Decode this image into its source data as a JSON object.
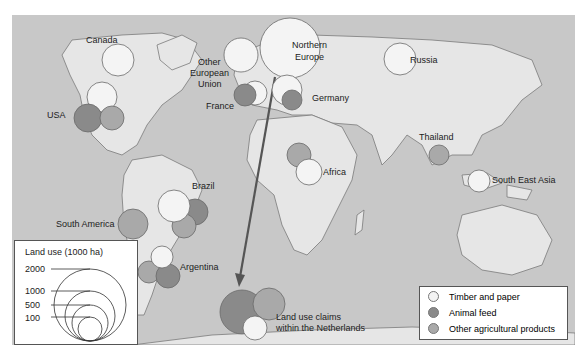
{
  "colors": {
    "ocean": "#c8c8c8",
    "land": "#e6e6e6",
    "coast": "#7a7a7a",
    "timber": "#f4f4f4",
    "feed": "#8a8a8a",
    "other": "#a9a9a9",
    "arrow": "#555555"
  },
  "labels": {
    "canada": "Canada",
    "usa": "USA",
    "other_eu_1": "Other",
    "other_eu_2": "European",
    "other_eu_3": "Union",
    "northern_europe_1": "Northern",
    "northern_europe_2": "Europe",
    "france": "France",
    "germany": "Germany",
    "russia": "Russia",
    "thailand": "Thailand",
    "south_east_asia": "South East Asia",
    "africa": "Africa",
    "brazil": "Brazil",
    "south_america": "South America",
    "argentina": "Argentina",
    "netherlands_1": "Land use claims",
    "netherlands_2": "within the Netherlands"
  },
  "size_legend": {
    "title": "Land use (1000 ha)",
    "values": [
      "2000",
      "1000",
      "500",
      "100"
    ]
  },
  "category_legend": {
    "items": [
      {
        "label": "Timber and paper",
        "color": "#f4f4f4"
      },
      {
        "label": "Animal feed",
        "color": "#8a8a8a"
      },
      {
        "label": "Other agricultural products",
        "color": "#a9a9a9"
      }
    ]
  }
}
